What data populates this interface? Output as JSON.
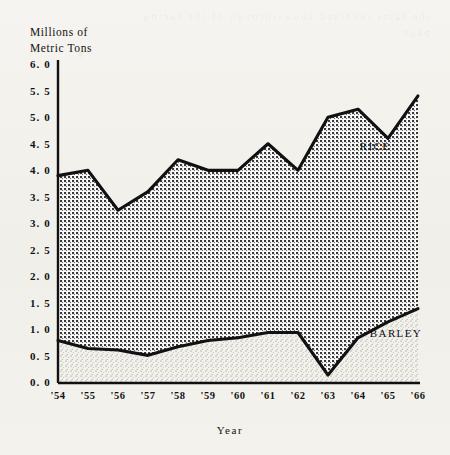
{
  "figure": {
    "y_axis_title_line1": "Millions of",
    "y_axis_title_line2": "Metric Tons",
    "x_axis_title": "Year",
    "rice_label": "RICE",
    "barley_label": "BARLEY",
    "background_color": "#f4f2ee",
    "line_color": "#111111",
    "rice_fill_color": "#9a9a9a",
    "barley_fill_color": "#d9d7d2"
  },
  "chart_data": {
    "type": "area",
    "title": "",
    "subtitle": "",
    "xlabel": "Year",
    "ylabel": "Millions of Metric Tons",
    "stacked": true,
    "grid": false,
    "legend": "inline-annotations",
    "xlim": [
      "'54",
      "'66"
    ],
    "ylim": [
      0.0,
      6.0
    ],
    "ytick_labels": [
      "6. 0",
      "5. 5",
      "5. 0",
      "4. 5",
      "4. 0",
      "3. 5",
      "3. 0",
      "2. 5",
      "2. 0",
      "1. 5",
      "1. 0",
      "0. 5",
      "0. 0"
    ],
    "ytick_values": [
      6.0,
      5.5,
      5.0,
      4.5,
      4.0,
      3.5,
      3.0,
      2.5,
      2.0,
      1.5,
      1.0,
      0.5,
      0.0
    ],
    "categories": [
      "'54",
      "'55",
      "'56",
      "'57",
      "'58",
      "'59",
      "'60",
      "'61",
      "'62",
      "'63",
      "'64",
      "'65",
      "'66"
    ],
    "series": [
      {
        "name": "BARLEY",
        "values": [
          0.8,
          0.65,
          0.62,
          0.52,
          0.68,
          0.8,
          0.85,
          0.95,
          0.95,
          0.15,
          0.85,
          1.15,
          1.4
        ]
      },
      {
        "name": "RICE",
        "values": [
          3.1,
          3.35,
          2.63,
          3.08,
          3.52,
          3.2,
          3.15,
          3.55,
          3.05,
          4.85,
          4.3,
          3.45,
          4.0
        ]
      }
    ],
    "cumulative_totals": [
      3.9,
      4.0,
      3.25,
      3.6,
      4.2,
      4.0,
      4.0,
      4.5,
      4.0,
      5.0,
      5.15,
      4.6,
      5.4
    ]
  },
  "ghost_text": "the faint reversed show-through of the facing page"
}
